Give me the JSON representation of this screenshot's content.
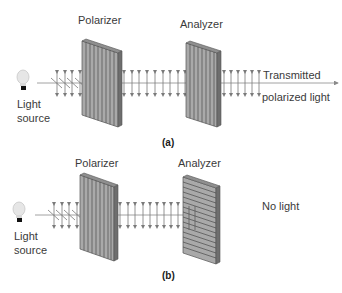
{
  "panel_a": {
    "caption": "(a)",
    "polarizer_label": "Polarizer",
    "analyzer_label": "Analyzer",
    "source_label_line1": "Light",
    "source_label_line2": "source",
    "result_line1": "Transmitted",
    "result_line2": "polarized light",
    "polarizer_orientation": "vertical",
    "analyzer_orientation": "vertical"
  },
  "panel_b": {
    "caption": "(b)",
    "polarizer_label": "Polarizer",
    "analyzer_label": "Analyzer",
    "source_label_line1": "Light",
    "source_label_line2": "source",
    "result_line1": "No light",
    "polarizer_orientation": "vertical",
    "analyzer_orientation": "horizontal"
  },
  "colors": {
    "filter_face": "#a9a9a9",
    "filter_side": "#6e6e6e",
    "filter_lines": "#4a4a4a",
    "wave_arrows": "#7a7a7a",
    "beam": "#8a8a8a",
    "text": "#3a3a3a"
  }
}
